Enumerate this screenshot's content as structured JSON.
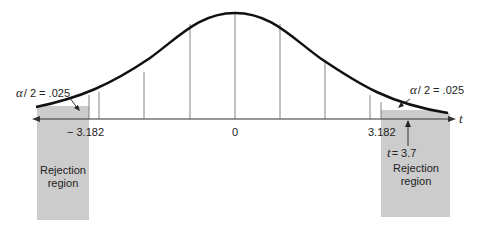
{
  "diagram": {
    "type": "t-distribution two-tailed rejection regions",
    "axis_label": "t",
    "center_label": "0",
    "left_critical": "− 3.182",
    "right_critical": "3.182",
    "left_tail_label_alpha": "α",
    "left_tail_label_rest": "/ 2 = .025",
    "right_tail_label_alpha": "α",
    "right_tail_label_rest": "/ 2 = .025",
    "test_stat_t": "t",
    "test_stat_rest": "= 3.7",
    "left_region_line1": "Rejection",
    "left_region_line2": "region",
    "right_region_line1": "Rejection",
    "right_region_line2": "region",
    "colors": {
      "shade": "#cccccc",
      "curve": "#111111",
      "gridline": "#555555",
      "text": "#222222"
    }
  }
}
